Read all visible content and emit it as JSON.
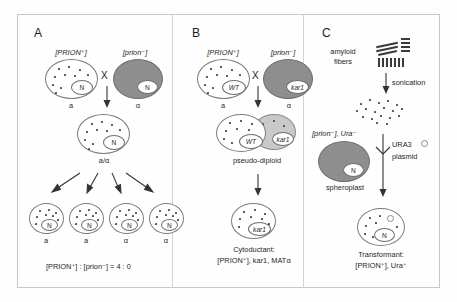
{
  "figure": {
    "width": 457,
    "height": 302,
    "background": "#fdfdfd",
    "border_color": "#c8c8c8"
  },
  "colors": {
    "prion_positive_cell": "#ffffff",
    "prion_negative_cell": "#8e8e8e",
    "pseudo_diploid_donor_lobe": "#c9c9c9",
    "nucleus_fill": "#ffffff",
    "prion_particle": "#4a4a4a",
    "outline": "#7b7b7b",
    "text": "#1f1f1f"
  },
  "panels": [
    {
      "id": "A",
      "letter": "A",
      "topic": "standard-mating-cross",
      "parents": [
        {
          "genotype_label": "[PRION⁺]",
          "mating_type": "a",
          "nucleus": "N",
          "prion_state": "positive",
          "cell_fill": "white",
          "particles": 11
        },
        {
          "genotype_label": "[prion⁻]",
          "mating_type": "α",
          "nucleus": "N",
          "prion_state": "negative",
          "cell_fill": "dark",
          "particles": 0
        }
      ],
      "cross_symbol": "X",
      "zygote": {
        "label": "a/α",
        "nucleus": "N",
        "prion_state": "positive",
        "particles": 11
      },
      "progeny": [
        {
          "mating_type": "a",
          "nucleus": "N",
          "prion_state": "positive"
        },
        {
          "mating_type": "a",
          "nucleus": "N",
          "prion_state": "positive"
        },
        {
          "mating_type": "α",
          "nucleus": "N",
          "prion_state": "positive"
        },
        {
          "mating_type": "α",
          "nucleus": "N",
          "prion_state": "positive"
        }
      ],
      "ratio": {
        "numerator": "[PRION⁺]",
        "denominator": "[prion⁻]",
        "value": "4 : 0",
        "full_text": "[PRION⁺] : [prion⁻] = 4 : 0"
      }
    },
    {
      "id": "B",
      "letter": "B",
      "topic": "cytoduction-kar1-cross",
      "parents": [
        {
          "genotype_label": "[PRION⁺]",
          "mating_type": "a",
          "nucleus": "WT",
          "prion_state": "positive",
          "cell_fill": "white",
          "particles": 11
        },
        {
          "genotype_label": "[prion⁻]",
          "mating_type": "α",
          "nucleus": "kar1",
          "prion_state": "negative",
          "cell_fill": "dark",
          "particles": 0
        }
      ],
      "cross_symbol": "X",
      "heterokaryon": {
        "label": "pseudo-diploid",
        "nuclei": [
          "WT",
          "kar1"
        ],
        "prion_state": "positive"
      },
      "product": {
        "nucleus": "kar1",
        "prion_state": "positive",
        "caption_line1": "Cytoductant:",
        "caption_line2": "[PRION⁺], kar1, MATα"
      }
    },
    {
      "id": "C",
      "letter": "C",
      "topic": "protein-transformation",
      "fibers_label_line1": "amyloid",
      "fibers_label_line2": "fibers",
      "step_label": "sonication",
      "recipient": {
        "genotype_label": "[prion⁻], Ura⁻",
        "nucleus": "N",
        "prion_state": "negative",
        "cell_label": "spheroplast"
      },
      "plasmid_label_line1": "URA3",
      "plasmid_label_line2": "plasmid",
      "plasmid_glyph": "circle",
      "product": {
        "nucleus": "N",
        "prion_state": "positive",
        "has_plasmid": true,
        "caption_line1": "Transformant:",
        "caption_line2": "[PRION⁺], Ura⁺"
      }
    }
  ]
}
